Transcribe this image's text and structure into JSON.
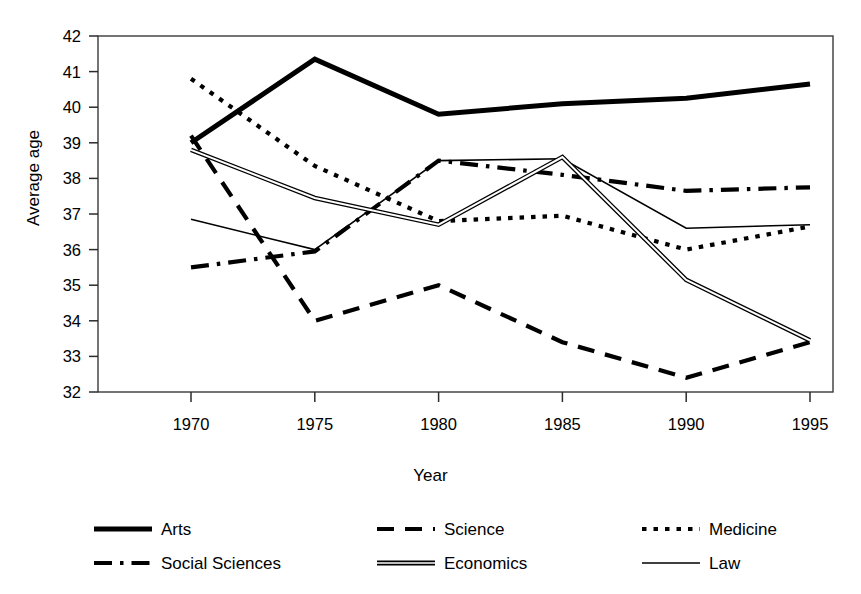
{
  "chart_data": {
    "type": "line",
    "title": "",
    "xlabel": "Year",
    "ylabel": "Average age",
    "x": [
      1970,
      1975,
      1980,
      1985,
      1990,
      1995
    ],
    "xtick_labels": [
      "1970",
      "1975",
      "1980",
      "1985",
      "1990",
      "1995"
    ],
    "ytick_labels": [
      "32",
      "33",
      "34",
      "35",
      "36",
      "37",
      "38",
      "39",
      "40",
      "41",
      "42"
    ],
    "xlim": [
      1968.5,
      1996.5
    ],
    "ylim": [
      32,
      42
    ],
    "grid": false,
    "legend_position": "bottom",
    "series": [
      {
        "name": "Arts",
        "style": "solid-thick",
        "color": "#000000",
        "values": [
          39.0,
          41.35,
          39.8,
          40.1,
          40.25,
          40.65
        ]
      },
      {
        "name": "Science",
        "style": "dashed",
        "color": "#000000",
        "values": [
          39.2,
          34.0,
          35.0,
          33.4,
          32.4,
          33.4
        ]
      },
      {
        "name": "Medicine",
        "style": "dotted",
        "color": "#000000",
        "values": [
          40.8,
          38.35,
          36.8,
          36.95,
          36.0,
          36.65
        ]
      },
      {
        "name": "Social Sciences",
        "style": "dash-dot",
        "color": "#000000",
        "values": [
          35.5,
          35.95,
          38.5,
          38.1,
          37.65,
          37.75
        ]
      },
      {
        "name": "Economics",
        "style": "double-thick",
        "color": "#000000",
        "values": [
          38.8,
          37.45,
          36.7,
          38.6,
          35.15,
          33.45
        ]
      },
      {
        "name": "Law",
        "style": "solid-thin",
        "color": "#000000",
        "values": [
          36.85,
          36.0,
          38.5,
          38.55,
          36.6,
          36.7
        ]
      }
    ]
  },
  "axes": {
    "ylabel": "Average age",
    "xlabel": "Year",
    "ytick_labels": [
      "42",
      "41",
      "40",
      "39",
      "38",
      "37",
      "36",
      "35",
      "34",
      "33",
      "32"
    ],
    "xtick_labels": [
      "1970",
      "1975",
      "1980",
      "1985",
      "1990",
      "1995"
    ]
  },
  "legend": {
    "rows": [
      [
        {
          "label": "Arts",
          "style": "solid-thick"
        },
        {
          "label": "Science",
          "style": "dashed"
        },
        {
          "label": "Medicine",
          "style": "dotted"
        }
      ],
      [
        {
          "label": "Social Sciences",
          "style": "dash-dot"
        },
        {
          "label": "Economics",
          "style": "double-thick"
        },
        {
          "label": "Law",
          "style": "solid-thin"
        }
      ]
    ]
  }
}
